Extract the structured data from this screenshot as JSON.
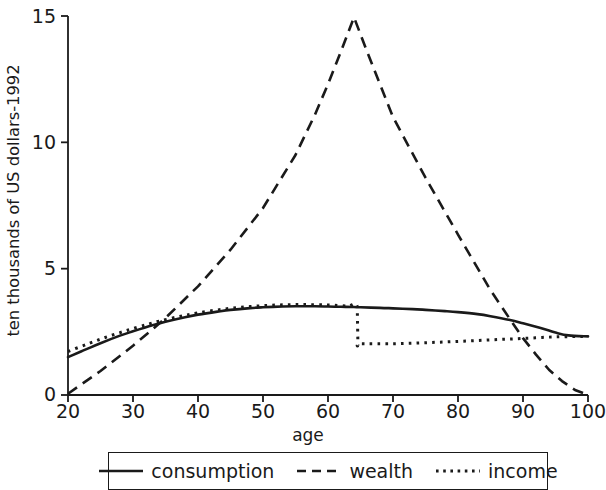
{
  "chart_data": {
    "type": "line",
    "title": "",
    "xlabel": "age",
    "ylabel": "ten thousands of US dollars-1992",
    "xlim": [
      20,
      100
    ],
    "ylim": [
      0,
      15
    ],
    "xticks": [
      20,
      30,
      40,
      50,
      60,
      70,
      80,
      90,
      100
    ],
    "xtick_labels": [
      "20",
      "30",
      "40",
      "50",
      "60",
      "70",
      "80",
      "90",
      "100"
    ],
    "yticks": [
      0,
      5,
      10,
      15
    ],
    "ytick_labels": [
      "0",
      "5",
      "10",
      "15"
    ],
    "grid": false,
    "legend_position": "below-center",
    "series": [
      {
        "name": "consumption",
        "style": "solid",
        "color": "#1a1a1a",
        "x": [
          20,
          22,
          25,
          28,
          30,
          33,
          35,
          38,
          40,
          43,
          45,
          48,
          50,
          53,
          55,
          58,
          60,
          62,
          64,
          65,
          68,
          70,
          73,
          75,
          78,
          80,
          83,
          85,
          88,
          90,
          92,
          94,
          95,
          97,
          100
        ],
        "y": [
          1.5,
          1.72,
          2.05,
          2.35,
          2.52,
          2.76,
          2.9,
          3.08,
          3.18,
          3.3,
          3.37,
          3.44,
          3.47,
          3.5,
          3.51,
          3.51,
          3.5,
          3.49,
          3.48,
          3.47,
          3.45,
          3.43,
          3.4,
          3.37,
          3.32,
          3.28,
          3.2,
          3.12,
          2.97,
          2.84,
          2.7,
          2.55,
          2.47,
          2.36,
          2.32
        ]
      },
      {
        "name": "wealth",
        "style": "dashed",
        "color": "#1a1a1a",
        "x": [
          20,
          25,
          30,
          33,
          35,
          40,
          45,
          50,
          55,
          58,
          60,
          62,
          64,
          66,
          70,
          75,
          80,
          85,
          88,
          90,
          92,
          94,
          96,
          98,
          100
        ],
        "y": [
          0.05,
          0.95,
          1.95,
          2.6,
          3.05,
          4.3,
          5.75,
          7.4,
          9.5,
          11.1,
          12.3,
          13.6,
          14.95,
          13.6,
          11.0,
          8.6,
          6.35,
          4.15,
          3.0,
          2.25,
          1.6,
          1.0,
          0.55,
          0.2,
          0.0
        ]
      },
      {
        "name": "income",
        "style": "dotted",
        "color": "#1a1a1a",
        "x": [
          20,
          23,
          26,
          29,
          32,
          34,
          37,
          40,
          44,
          48,
          52,
          56,
          60,
          63,
          64.5,
          64.6,
          65,
          70,
          75,
          80,
          85,
          90,
          95,
          100
        ],
        "y": [
          1.72,
          2.02,
          2.3,
          2.55,
          2.78,
          2.92,
          3.1,
          3.25,
          3.4,
          3.5,
          3.56,
          3.58,
          3.56,
          3.52,
          3.5,
          2.05,
          2.03,
          2.03,
          2.07,
          2.12,
          2.18,
          2.24,
          2.3,
          2.32
        ]
      }
    ],
    "annotations": []
  },
  "legend": {
    "items": [
      {
        "label": "consumption",
        "swatch": "solid-line-swatch"
      },
      {
        "label": "wealth",
        "swatch": "dashed-line-swatch"
      },
      {
        "label": "income",
        "swatch": "dotted-line-swatch"
      }
    ]
  },
  "colors": {
    "ink": "#1a1a1a",
    "background": "#ffffff"
  }
}
